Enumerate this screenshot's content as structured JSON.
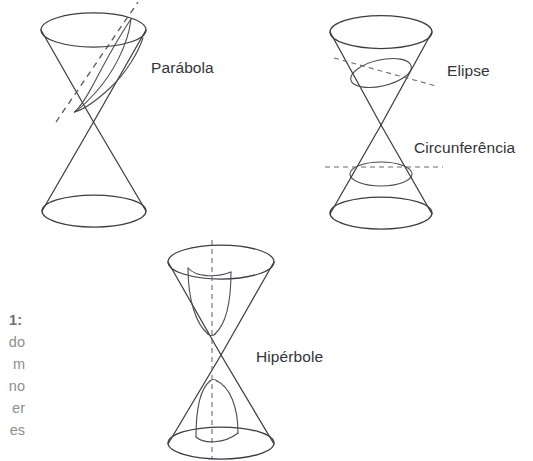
{
  "figure": {
    "title_alt": "Secoes conicas",
    "background_color": "#ffffff",
    "line_color": "#3c3c44",
    "label_color": "#333338",
    "caption_color": "#8e8e90"
  },
  "labels": {
    "parabola": "Parábola",
    "elipse": "Elipse",
    "circunferencia": "Circunferência",
    "hiperbole": "Hipérbole"
  },
  "caption": {
    "clipped": true,
    "lines": [
      "1:",
      "do",
      "m",
      "no",
      "er",
      "es"
    ]
  },
  "diagrams": [
    {
      "id": "parabola-cone",
      "label": "Parábola",
      "cut_type": "oblique-parallel-to-generatrix",
      "cut_line_style": "dashed",
      "section_curve": "parabola"
    },
    {
      "id": "elipse-circunferencia-cone",
      "labels": [
        "Elipse",
        "Circunferência"
      ],
      "cut_type": "oblique-and-horizontal",
      "cut_line_style": "dashed",
      "section_curves": [
        "ellipse",
        "circle"
      ]
    },
    {
      "id": "hiperbole-cone",
      "label": "Hipérbole",
      "cut_type": "vertical",
      "cut_line_style": "dashed",
      "section_curve": "hyperbola"
    }
  ]
}
